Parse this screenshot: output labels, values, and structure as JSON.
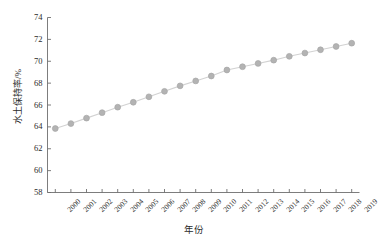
{
  "chart_data": {
    "type": "line",
    "title": "",
    "xlabel": "年份",
    "ylabel": "水土保持率/%",
    "x": [
      2000,
      2001,
      2002,
      2003,
      2004,
      2005,
      2006,
      2007,
      2008,
      2009,
      2010,
      2011,
      2012,
      2013,
      2014,
      2015,
      2016,
      2017,
      2018,
      2019
    ],
    "categories": [
      "2000",
      "2001",
      "2002",
      "2003",
      "2004",
      "2005",
      "2006",
      "2007",
      "2008",
      "2009",
      "2010",
      "2011",
      "2012",
      "2013",
      "2014",
      "2015",
      "2016",
      "2017",
      "2018",
      "2019"
    ],
    "series": [
      {
        "name": "水土保持率",
        "values": [
          63.85,
          64.3,
          64.8,
          65.3,
          65.8,
          66.25,
          66.75,
          67.25,
          67.75,
          68.2,
          68.65,
          69.2,
          69.5,
          69.8,
          70.1,
          70.45,
          70.75,
          71.05,
          71.35,
          71.65
        ]
      }
    ],
    "ylim": [
      58,
      74
    ],
    "yticks": [
      58,
      60,
      62,
      64,
      66,
      68,
      70,
      72,
      74
    ],
    "ytick_labels": [
      "58",
      "60",
      "62",
      "64",
      "66",
      "68",
      "70",
      "72",
      "74"
    ],
    "xlim": [
      1999.5,
      2019.5
    ],
    "grid": false,
    "legend": "none",
    "marker": "circle",
    "colors": {
      "marker_fill": "#b3b3b3",
      "marker_edge": "#a6a6a6",
      "line": "#d2d2d2",
      "axis": "#6e6e6e",
      "text": "#2b2b2b",
      "background": "#ffffff"
    }
  }
}
